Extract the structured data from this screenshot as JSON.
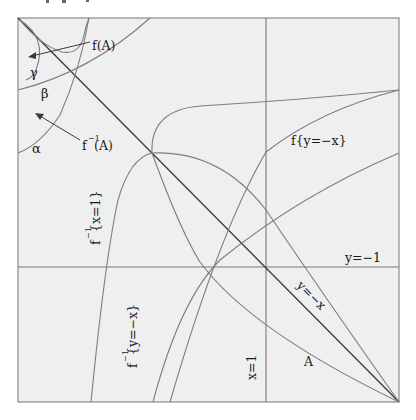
{
  "figure": {
    "labels": {
      "fA": "f(A)",
      "gamma": "γ",
      "beta": "β",
      "alpha": "α",
      "finvA_f": "f",
      "finvA_sup": "−1",
      "finvA_arg": "(A)",
      "f_y_minus1": "f{y=−1}",
      "f_y_minus_x": "f{y=−x}",
      "finv_x1_f": "f",
      "finv_x1_sup": "−1",
      "finv_x1_arg": "{x=1}",
      "finv_yx_f": "f",
      "finv_yx_sup": "−1",
      "finv_yx_arg": "{y=−x}",
      "y_minus1": "y=−1",
      "y_minus_x": "y=−x",
      "x_eq_1": "x=1",
      "A": "A"
    },
    "colors": {
      "background": "#efefef",
      "frame": "#8a8a8a",
      "curves": "#7d7d7d",
      "diagonal": "#3a3a3a",
      "text": "#1a1a1a"
    }
  }
}
